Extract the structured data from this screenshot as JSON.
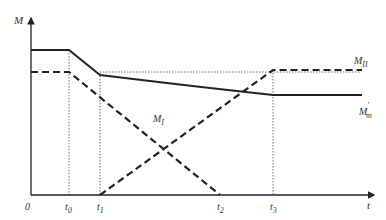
{
  "axes": {
    "y_label": "M",
    "x_label": "t",
    "origin_label": "0"
  },
  "ticks": [
    {
      "base": "t",
      "sub": "0"
    },
    {
      "base": "t",
      "sub": "1"
    },
    {
      "base": "t",
      "sub": "2"
    },
    {
      "base": "t",
      "sub": "3"
    }
  ],
  "curves": {
    "m1": {
      "base": "M",
      "sub": "I"
    },
    "m2": {
      "base": "M",
      "sub": "II"
    },
    "mm": {
      "base": "M",
      "sub": "m",
      "sup": "′"
    }
  },
  "colors": {
    "line": "#222222",
    "dotted": "#444444"
  }
}
